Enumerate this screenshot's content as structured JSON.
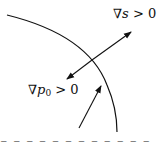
{
  "figure": {
    "labels": {
      "grad_s": {
        "nabla": "∇",
        "var": "s",
        "rel": " > 0"
      },
      "grad_p0": {
        "nabla": "∇",
        "var": "p",
        "sub": "0",
        "rel": " > 0"
      }
    },
    "bottom_caption_truncated": "Isobaric surface / flame front (cut off)",
    "colors": {
      "stroke": "#111111",
      "background": "#ffffff"
    }
  }
}
